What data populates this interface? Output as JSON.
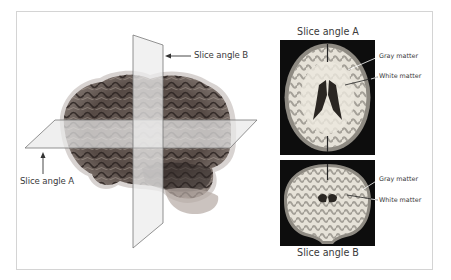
{
  "figure": {
    "left_panel": {
      "description": "3D brain with two intersecting slice planes",
      "label_slice_b": "Slice angle B",
      "label_slice_a": "Slice angle A"
    },
    "right_panel": {
      "top_image": {
        "title": "Slice angle A",
        "view": "axial MRI slice",
        "labels": [
          "Gray matter",
          "White matter"
        ]
      },
      "bottom_image": {
        "title": "Slice angle B",
        "view": "coronal MRI slice",
        "labels": [
          "Gray matter",
          "White matter"
        ]
      }
    },
    "colors": {
      "border": "#d4d4d4",
      "plane_fill": "#e8e8e8",
      "plane_edge": "#777777",
      "brain_dark": "#3b3330",
      "brain_mid": "#7a6e68",
      "mri_background": "#0d0d0d",
      "mri_white": "#e6e2d8",
      "mri_gray": "#8e8a82"
    }
  }
}
